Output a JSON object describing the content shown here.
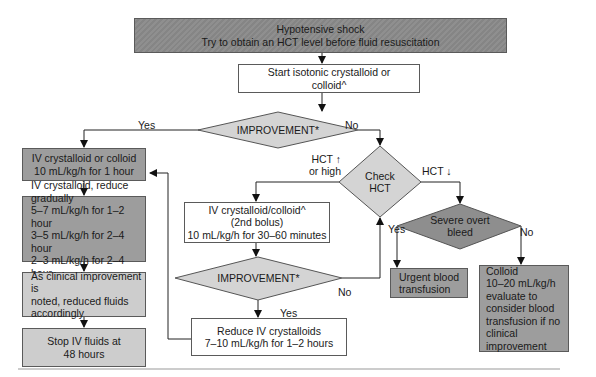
{
  "flowchart": {
    "title_box": {
      "line1": "Hypotensive shock",
      "line2": "Try to obtain an HCT level before fluid resuscitation"
    },
    "start_box": {
      "line1": "Start isotonic crystalloid or",
      "line2": "colloid^"
    },
    "decision_improvement_1": {
      "text": "IMPROVEMENT*",
      "yes_label": "Yes",
      "no_label": "No"
    },
    "left_column": {
      "box1": {
        "line1": "IV crystalloid or colloid",
        "line2": "10 mL/kg/h for 1 hour"
      },
      "box2": {
        "line1": "IV crystalloid, reduce",
        "line2": "gradually",
        "line3": "5–7 mL/kg/h for 1–2 hour",
        "line4": "3–5 mL/kg/h for 2–4 hour",
        "line5": "2–3 mL/kg/h for 2–4 hour"
      },
      "box3": {
        "line1": "As clinical improvement is",
        "line2": "noted, reduced fluids",
        "line3": "accordingly"
      },
      "box4": {
        "line1": "Stop IV fluids at",
        "line2": "48 hours"
      }
    },
    "decision_check_hct": {
      "line1": "Check",
      "line2": "HCT",
      "high_label_line1": "HCT ↑",
      "high_label_line2": "or high",
      "low_label": "HCT ↓"
    },
    "second_bolus_box": {
      "line1": "IV crystalloid/colloid^",
      "line2": "(2nd bolus)",
      "line3": "10 mL/kg/h for 30–60 minutes"
    },
    "decision_improvement_2": {
      "text": "IMPROVEMENT*",
      "yes_label": "Yes",
      "no_label": "No"
    },
    "reduce_box": {
      "line1": "Reduce IV crystalloids",
      "line2": "7–10 mL/kg/h for 1–2 hours"
    },
    "decision_bleed": {
      "line1": "Severe overt",
      "line2": "bleed",
      "yes_label": "Yes",
      "no_label": "No"
    },
    "urgent_box": {
      "line1": "Urgent blood",
      "line2": "transfusion"
    },
    "colloid_box": {
      "line1": "Colloid",
      "line2": "10–20 mL/kg/h",
      "line3": "evaluate to",
      "line4": "consider blood",
      "line5": "transfusion if no",
      "line6": "clinical",
      "line7": "improvement"
    }
  },
  "colors": {
    "title_fill": "#8c8c8c",
    "dark_fill": "#9d9d9d",
    "light_fill": "#cdcdcd",
    "diamond_light": "#d4d4d4",
    "diamond_dark": "#8e8e8e",
    "stroke": "#1a1a1a"
  }
}
